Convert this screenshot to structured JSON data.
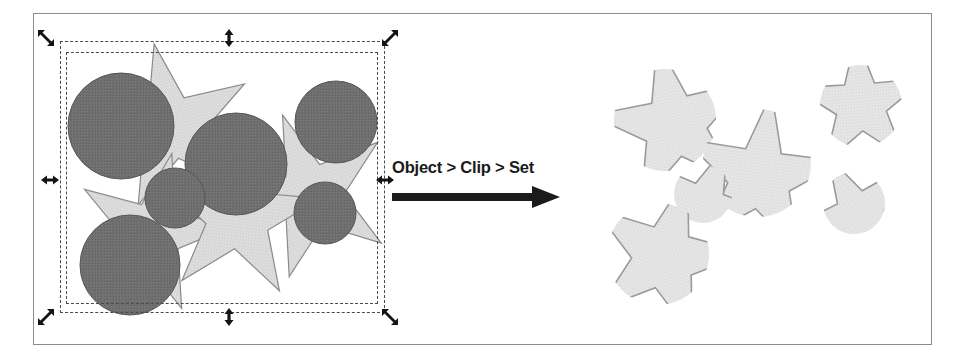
{
  "figure": {
    "frame": {
      "border_color": "#8c8c8c",
      "background": "#ffffff"
    }
  },
  "transition": {
    "label": "Object > Clip > Set",
    "arrow_icon": "right-arrow-icon",
    "arrow_color": "#1b1b1b"
  },
  "palette": {
    "circle_fill": "#6f6f6f",
    "circle_stroke": "#555555",
    "star_fill": "#d9d9d9",
    "star_stroke": "#8a8a8a",
    "clipped_fill": "#e2e2e2",
    "clipped_stroke": "#999999",
    "selection_dash": "#4a4a4a",
    "handle_color": "#141414",
    "text_color": "#1b1b1b"
  },
  "selection": {
    "name": "bounding-box",
    "outer_rect": {
      "x": 60,
      "y": 41,
      "w": 325,
      "h": 272
    },
    "inner_rect": {
      "x": 66,
      "y": 52,
      "w": 312,
      "h": 252
    },
    "handles": [
      {
        "name": "handle-top-left",
        "icon": "resize-nwse-icon",
        "x": 46,
        "y": 38
      },
      {
        "name": "handle-top-center",
        "icon": "resize-ns-icon",
        "x": 229,
        "y": 38
      },
      {
        "name": "handle-top-right",
        "icon": "resize-nesw-icon",
        "x": 390,
        "y": 38
      },
      {
        "name": "handle-middle-left",
        "icon": "resize-ew-icon",
        "x": 50,
        "y": 180
      },
      {
        "name": "handle-middle-right",
        "icon": "resize-ew-icon",
        "x": 385,
        "y": 180
      },
      {
        "name": "handle-bottom-left",
        "icon": "resize-nesw-icon",
        "x": 46,
        "y": 317
      },
      {
        "name": "handle-bottom-center",
        "icon": "resize-ns-icon",
        "x": 229,
        "y": 317
      },
      {
        "name": "handle-bottom-right",
        "icon": "resize-nwse-icon",
        "x": 390,
        "y": 317
      }
    ]
  },
  "before_artwork": {
    "name": "unclipped-artwork",
    "description": "Overlapping gray circles on top of light gray stars, with selection bounding box",
    "stars": [
      {
        "name": "star-top-left",
        "cx": 172,
        "cy": 128,
        "r_outer": 86,
        "r_inner": 38,
        "rotation": -12
      },
      {
        "name": "star-bottom-left",
        "cx": 152,
        "cy": 233,
        "r_outer": 82,
        "r_inner": 36,
        "rotation": 14
      },
      {
        "name": "star-center",
        "cx": 238,
        "cy": 216,
        "r_outer": 84,
        "r_inner": 37,
        "rotation": 6
      },
      {
        "name": "star-right",
        "cx": 312,
        "cy": 196,
        "r_outer": 86,
        "r_inner": 38,
        "rotation": -20
      }
    ],
    "circles": [
      {
        "name": "circle-large-topleft",
        "cx": 121,
        "cy": 126,
        "r": 53
      },
      {
        "name": "circle-large-center",
        "cx": 236,
        "cy": 164,
        "r": 51
      },
      {
        "name": "circle-large-bottomleft",
        "cx": 130,
        "cy": 265,
        "r": 50
      },
      {
        "name": "circle-medium-topright",
        "cx": 336,
        "cy": 122,
        "r": 41
      },
      {
        "name": "circle-small-midleft",
        "cx": 175,
        "cy": 198,
        "r": 30
      },
      {
        "name": "circle-small-midright",
        "cx": 325,
        "cy": 213,
        "r": 31
      }
    ]
  },
  "after_artwork": {
    "name": "clipped-artwork",
    "description": "Star shapes clipped by circle masks, producing light gray fragments",
    "fragments": [
      {
        "name": "clipped-shape-topleft",
        "cx": 660,
        "cy": 126
      },
      {
        "name": "clipped-shape-center",
        "cx": 755,
        "cy": 170
      },
      {
        "name": "clipped-shape-topright",
        "cx": 860,
        "cy": 110
      },
      {
        "name": "clipped-shape-smallcenter",
        "cx": 698,
        "cy": 198
      },
      {
        "name": "clipped-shape-smallright",
        "cx": 852,
        "cy": 207
      },
      {
        "name": "clipped-shape-bottomleft",
        "cx": 652,
        "cy": 258
      }
    ]
  }
}
